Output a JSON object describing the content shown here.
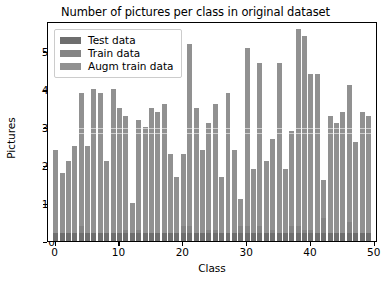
{
  "chart_data": {
    "type": "bar",
    "title": "Number of pictures per class in original dataset",
    "xlabel": "Class",
    "ylabel": "Pictures",
    "xlim": [
      -1.2,
      50.5
    ],
    "ylim": [
      0,
      58
    ],
    "xticks": [
      0,
      10,
      20,
      30,
      40,
      50
    ],
    "yticks": [
      0,
      10,
      20,
      30,
      40,
      50
    ],
    "grid": false,
    "legend_position": "upper left",
    "stacking": "overlaid",
    "categories": [
      0,
      1,
      2,
      3,
      4,
      5,
      6,
      7,
      8,
      9,
      10,
      11,
      12,
      13,
      14,
      15,
      16,
      17,
      18,
      19,
      20,
      21,
      22,
      23,
      24,
      25,
      26,
      27,
      28,
      29,
      30,
      31,
      32,
      33,
      34,
      35,
      36,
      37,
      38,
      39,
      40,
      41,
      42,
      43,
      44,
      45,
      46,
      47,
      48,
      49
    ],
    "series": [
      {
        "name": "Augm train data",
        "color": "#919191",
        "values": [
          24,
          18,
          21,
          25,
          39,
          25,
          40,
          39,
          21,
          40,
          35,
          33,
          10,
          32,
          30,
          35,
          34,
          36,
          23,
          17,
          23,
          52,
          35,
          24,
          31,
          36,
          17,
          39,
          24,
          11,
          51,
          19,
          47,
          21,
          27,
          47,
          19,
          29,
          56,
          54,
          44,
          44,
          16,
          33,
          31,
          34,
          41,
          26,
          34,
          33
        ]
      },
      {
        "name": "Train data",
        "color": "#848484",
        "values": [
          2,
          2,
          2,
          2,
          4,
          2,
          2,
          2,
          2,
          2,
          2,
          3,
          2,
          3,
          2,
          2,
          2,
          2,
          2,
          2,
          4,
          4,
          2,
          2,
          3,
          3,
          2,
          2,
          2,
          4,
          4,
          2,
          4,
          2,
          3,
          2,
          2,
          4,
          4,
          3,
          3,
          2,
          6,
          2,
          2,
          2,
          5,
          2,
          2,
          2
        ]
      },
      {
        "name": "Test data",
        "color": "#6e6e6e",
        "values": [
          2,
          2,
          2,
          2,
          2,
          2,
          2,
          2,
          2,
          2,
          2,
          2,
          2,
          2,
          2,
          2,
          2,
          2,
          2,
          2,
          2,
          2,
          2,
          2,
          2,
          2,
          2,
          2,
          2,
          2,
          2,
          2,
          2,
          2,
          2,
          2,
          2,
          2,
          2,
          2,
          2,
          2,
          2,
          2,
          2,
          2,
          2,
          2,
          2,
          2
        ]
      }
    ]
  },
  "legend": {
    "items": [
      {
        "label": "Test data",
        "color": "#6e6e6e"
      },
      {
        "label": "Train data",
        "color": "#848484"
      },
      {
        "label": "Augm train data",
        "color": "#919191"
      }
    ]
  }
}
